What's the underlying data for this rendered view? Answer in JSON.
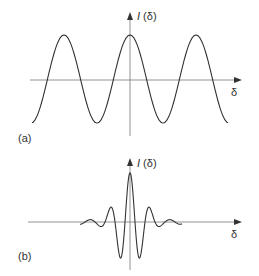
{
  "panel_a": {
    "label": "(a)",
    "y_axis_label": "I (δ)",
    "y_axis_italic": "I",
    "y_axis_arg": " (δ)",
    "x_axis_label": "δ",
    "curve": "cosine fringe pattern (monochromatic interferogram)",
    "colors": {
      "axis": "#555555",
      "curve": "#333333",
      "peak_highlight": "#3b4fb0"
    }
  },
  "panel_b": {
    "label": "(b)",
    "y_axis_label": "I (δ)",
    "y_axis_italic": "I",
    "y_axis_arg": " (δ)",
    "x_axis_label": "δ",
    "curve": "damped oscillating interferogram (broadband source)",
    "colors": {
      "axis": "#555555",
      "curve": "#333333"
    }
  }
}
